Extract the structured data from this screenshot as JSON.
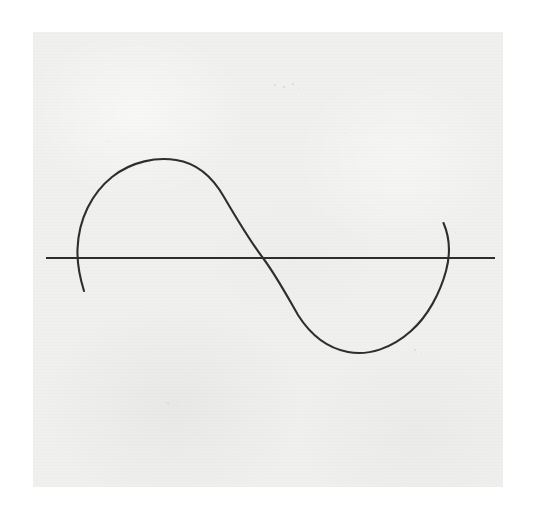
{
  "image": {
    "kind": "scanned-hand-drawing",
    "width": 542,
    "height": 517,
    "background_color": "#ffffff",
    "caption": ""
  },
  "paper": {
    "name": "scanned paper sheet",
    "left": 33,
    "top": 32,
    "width": 470,
    "height": 455,
    "color": "#f0f0ef",
    "texture": "faint fibrous scan grain with light mottling"
  },
  "ink": {
    "color": "#2e2e2e",
    "axis_stroke_width": 2.1,
    "curve_stroke_width": 2.1
  },
  "axis": {
    "label": "horizontal axis line",
    "y": 258,
    "x_start": 46,
    "x_end": 495,
    "color": "#2e2e2e"
  },
  "specks": [
    {
      "x": 274,
      "y": 84,
      "size": 2
    },
    {
      "x": 283,
      "y": 86,
      "size": 1.5
    },
    {
      "x": 292,
      "y": 83,
      "size": 1.5
    },
    {
      "x": 298,
      "y": 88,
      "size": 1
    },
    {
      "x": 414,
      "y": 349,
      "size": 1.5
    },
    {
      "x": 421,
      "y": 352,
      "size": 1
    },
    {
      "x": 455,
      "y": 232,
      "size": 1
    },
    {
      "x": 167,
      "y": 402,
      "size": 1.5
    },
    {
      "x": 176,
      "y": 406,
      "size": 1
    },
    {
      "x": 107,
      "y": 141,
      "size": 1
    },
    {
      "x": 345,
      "y": 133,
      "size": 1
    }
  ],
  "chart_data": {
    "type": "line",
    "title": "",
    "subtitle": "",
    "xlabel": "",
    "ylabel": "",
    "grid": false,
    "legend": null,
    "axis_y_pixels": 258,
    "zero_crossings_x_pixels": [
      77,
      263,
      447
    ],
    "period_pixels": 370,
    "crest": {
      "x": 175,
      "y": 160,
      "amplitude_pixels": 98
    },
    "trough": {
      "x": 360,
      "y": 353,
      "amplitude_pixels": 95
    },
    "left_tail_end": {
      "x": 84,
      "y": 291
    },
    "right_tail_start": {
      "x": 443,
      "y": 223
    },
    "series": [
      {
        "name": "sine curve",
        "color": "#2e2e2e",
        "x": [
          84,
          77,
          95,
          120,
          150,
          175,
          205,
          235,
          263,
          292,
          320,
          345,
          360,
          385,
          412,
          435,
          447,
          443
        ],
        "y": [
          291,
          250,
          205,
          178,
          163,
          160,
          166,
          200,
          257,
          305,
          336,
          350,
          353,
          348,
          325,
          285,
          258,
          223
        ]
      }
    ]
  }
}
